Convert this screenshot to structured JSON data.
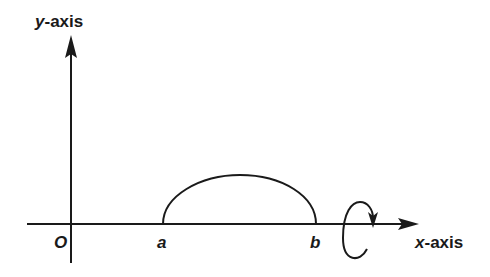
{
  "diagram": {
    "type": "solid-of-revolution",
    "axes": {
      "y_axis": {
        "var": "y",
        "suffix": "-axis"
      },
      "x_axis": {
        "var": "x",
        "suffix": "-axis"
      }
    },
    "points": {
      "origin": "O",
      "a": "a",
      "b": "b"
    },
    "curve": {
      "from": "a",
      "to": "b",
      "shape": "arch"
    },
    "rotation": {
      "about": "x-axis",
      "direction": "clockwise-indicator"
    },
    "colors": {
      "ink": "#1a1a1a",
      "background": "#ffffff"
    }
  }
}
